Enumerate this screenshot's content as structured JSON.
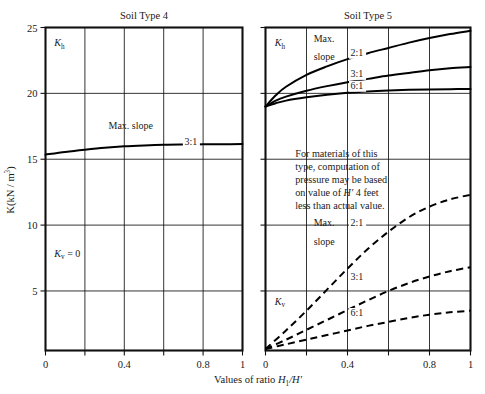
{
  "figure": {
    "axis_label_x": "Values of ratio",
    "axis_label_x_sym": "H",
    "axis_label_x_sub": "1",
    "axis_label_x_sym2": "/H′",
    "axis_label_y": "K(kN / m",
    "axis_label_y_sup": "3",
    "axis_label_y_close": ")"
  },
  "chart_data": [
    {
      "type": "line",
      "title": "Soil Type 4",
      "xlabel": "Values of ratio H1/H'",
      "ylabel": "K(kN/m3)",
      "xlim": [
        0,
        1
      ],
      "ylim": [
        0.48,
        25
      ],
      "xticks": [
        0,
        0.2,
        0.4,
        0.6,
        0.8,
        1
      ],
      "xticklabels": [
        "0",
        "",
        "0.4",
        "",
        "0.8",
        "1"
      ],
      "yticks": [
        5,
        10,
        15,
        20,
        25
      ],
      "yticklabels": [
        "5",
        "10",
        "15",
        "20",
        "25"
      ],
      "grid": true,
      "annotations": [
        {
          "text": "K",
          "sub": "h",
          "x": 0.045,
          "y": 23.6,
          "italic": true
        },
        {
          "text": "Max. slope",
          "x": 0.32,
          "y": 17.3
        },
        {
          "text": "K",
          "sub": "v",
          "suffix": " = 0",
          "x": 0.045,
          "y": 7.6,
          "italic": true
        }
      ],
      "series": [
        {
          "name": "3:1",
          "style": "solid",
          "label": "3:1",
          "label_x": 0.705,
          "label_y": 16.1,
          "x": [
            0,
            0.1,
            0.2,
            0.3,
            0.4,
            0.5,
            0.6,
            0.7,
            0.8,
            0.9,
            1.0
          ],
          "y": [
            15.35,
            15.55,
            15.72,
            15.87,
            15.98,
            16.05,
            16.1,
            16.12,
            16.13,
            16.14,
            16.15
          ]
        }
      ]
    },
    {
      "type": "line",
      "title": "Soil Type 5",
      "xlabel": "Values of ratio H1/H'",
      "xlim": [
        0,
        1
      ],
      "ylim": [
        0.48,
        25
      ],
      "xticks": [
        0,
        0.2,
        0.4,
        0.6,
        0.8,
        1
      ],
      "xticklabels": [
        "0",
        "",
        "0.4",
        "",
        "0.8",
        "1"
      ],
      "yticks": [
        5,
        10,
        15,
        20,
        25
      ],
      "grid": true,
      "note": "For materials of this type, computation of pressure may be based on value of H′ 4 feet less than actual value.",
      "note_lines": [
        "For materials of this",
        "type, computation of",
        "pressure may be based",
        "on value of H′ 4 feet",
        "less than actual value."
      ],
      "annotations": [
        {
          "text": "K",
          "sub": "h",
          "x": 0.045,
          "y": 23.6,
          "italic": true
        },
        {
          "text": "Max.",
          "x": 0.235,
          "y": 23.9
        },
        {
          "text": "slope",
          "x": 0.235,
          "y": 22.5
        },
        {
          "text": "Max.",
          "x": 0.235,
          "y": 9.9
        },
        {
          "text": "slope",
          "x": 0.235,
          "y": 8.5
        },
        {
          "text": "K",
          "sub": "v",
          "x": 0.045,
          "y": 3.95,
          "italic": true
        }
      ],
      "series": [
        {
          "name": "Kh 2:1",
          "style": "solid",
          "label": "2:1",
          "label_x": 0.415,
          "label_y": 22.85,
          "x": [
            0,
            0.05,
            0.1,
            0.2,
            0.3,
            0.4,
            0.5,
            0.6,
            0.7,
            0.8,
            0.9,
            1.0
          ],
          "y": [
            19.0,
            19.85,
            20.5,
            21.4,
            22.05,
            22.6,
            23.05,
            23.45,
            23.85,
            24.2,
            24.5,
            24.75
          ]
        },
        {
          "name": "Kh 3:1",
          "style": "solid",
          "label": "3:1",
          "label_x": 0.415,
          "label_y": 21.25,
          "x": [
            0,
            0.05,
            0.1,
            0.2,
            0.3,
            0.4,
            0.5,
            0.6,
            0.7,
            0.8,
            0.9,
            1.0
          ],
          "y": [
            19.0,
            19.45,
            19.75,
            20.2,
            20.55,
            20.85,
            21.1,
            21.35,
            21.55,
            21.75,
            21.9,
            22.0
          ]
        },
        {
          "name": "Kh 6:1",
          "style": "solid",
          "label": "6:1",
          "label_x": 0.415,
          "label_y": 20.35,
          "x": [
            0,
            0.05,
            0.1,
            0.2,
            0.3,
            0.4,
            0.5,
            0.6,
            0.7,
            0.8,
            0.9,
            1.0
          ],
          "y": [
            19.0,
            19.25,
            19.45,
            19.7,
            19.9,
            20.05,
            20.15,
            20.22,
            20.27,
            20.3,
            20.32,
            20.33
          ]
        },
        {
          "name": "Kv 2:1",
          "style": "dashed",
          "label": "2:1",
          "label_x": 0.415,
          "label_y": 9.9,
          "x": [
            0,
            0.1,
            0.2,
            0.3,
            0.4,
            0.5,
            0.6,
            0.7,
            0.8,
            0.9,
            1.0
          ],
          "y": [
            0.6,
            2.0,
            3.5,
            5.1,
            6.7,
            8.2,
            9.5,
            10.6,
            11.4,
            11.95,
            12.3
          ]
        },
        {
          "name": "Kv 3:1",
          "style": "dashed",
          "label": "3:1",
          "label_x": 0.415,
          "label_y": 5.8,
          "x": [
            0,
            0.1,
            0.2,
            0.3,
            0.4,
            0.5,
            0.6,
            0.7,
            0.8,
            0.9,
            1.0
          ],
          "y": [
            0.6,
            1.3,
            2.05,
            2.8,
            3.55,
            4.3,
            5.0,
            5.6,
            6.1,
            6.5,
            6.8
          ]
        },
        {
          "name": "Kv 6:1",
          "style": "dashed",
          "label": "6:1",
          "label_x": 0.415,
          "label_y": 3.1,
          "x": [
            0,
            0.1,
            0.2,
            0.3,
            0.4,
            0.5,
            0.6,
            0.7,
            0.8,
            0.9,
            1.0
          ],
          "y": [
            0.6,
            0.95,
            1.3,
            1.65,
            2.0,
            2.35,
            2.65,
            2.95,
            3.2,
            3.38,
            3.5
          ]
        }
      ]
    }
  ]
}
